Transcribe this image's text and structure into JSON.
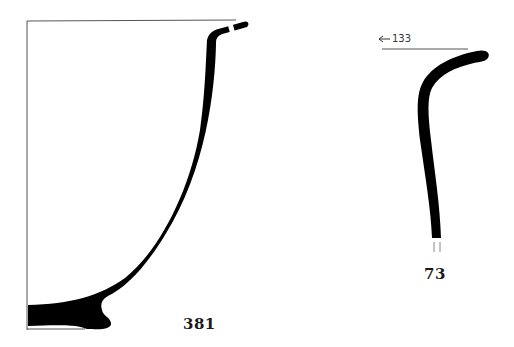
{
  "figure": {
    "profiles": [
      {
        "id": "vessel-381",
        "label": "381",
        "description": "Vessel profile section with flared rim and ring base, with diameter reference lines"
      },
      {
        "id": "vessel-73",
        "label": "73",
        "reference_arrow": "←133",
        "description": "Rim fragment profile with everted lip, broken lower edge"
      }
    ],
    "colors": {
      "section_fill": "#000000",
      "reference_line": "#555555",
      "background": "#ffffff"
    }
  }
}
